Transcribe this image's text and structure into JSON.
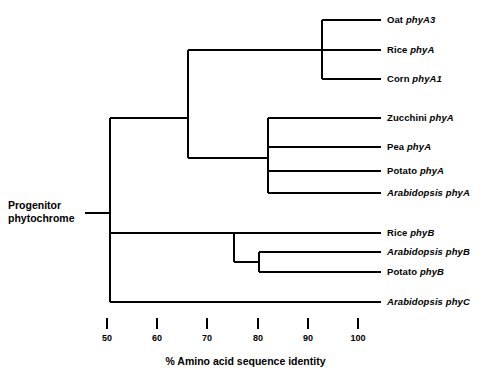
{
  "figure": {
    "type": "phylogenetic-tree",
    "root_label_line1": "Progenitor",
    "root_label_line2": "phytochrome",
    "axis_title": "% Amino acid sequence identity"
  },
  "axis": {
    "ticks": [
      {
        "value": 50,
        "label": "50",
        "x": 107
      },
      {
        "value": 60,
        "label": "60",
        "x": 157
      },
      {
        "value": 70,
        "label": "70",
        "x": 207
      },
      {
        "value": 80,
        "label": "80",
        "x": 258
      },
      {
        "value": 90,
        "label": "90",
        "x": 308
      },
      {
        "value": 100,
        "label": "100",
        "x": 358
      }
    ],
    "min": 50,
    "max": 100,
    "x_min_px": 107,
    "x_max_px": 358
  },
  "leaves": [
    {
      "organism": "Oat",
      "gene": "phyA3",
      "italic_organism": false,
      "y": 20,
      "branch_x": 322
    },
    {
      "organism": "Rice",
      "gene": "phyA",
      "italic_organism": false,
      "y": 50,
      "branch_x": 188
    },
    {
      "organism": "Corn",
      "gene": "phyA1",
      "italic_organism": false,
      "y": 79,
      "branch_x": 322
    },
    {
      "organism": "Zucchini",
      "gene": "phyA",
      "italic_organism": false,
      "y": 118,
      "branch_x": 268
    },
    {
      "organism": "Pea",
      "gene": "phyA",
      "italic_organism": false,
      "y": 147,
      "branch_x": 268
    },
    {
      "organism": "Potato",
      "gene": "phyA",
      "italic_organism": false,
      "y": 171,
      "branch_x": 268
    },
    {
      "organism": "Arabidopsis",
      "gene": "phyA",
      "italic_organism": true,
      "y": 193,
      "branch_x": 268
    },
    {
      "organism": "Rice",
      "gene": "phyB",
      "italic_organism": false,
      "y": 233,
      "branch_x": 234
    },
    {
      "organism": "Arabidopsis",
      "gene": "phyB",
      "italic_organism": true,
      "y": 252,
      "branch_x": 259
    },
    {
      "organism": "Potato",
      "gene": "phyB",
      "italic_organism": false,
      "y": 272,
      "branch_x": 259
    },
    {
      "organism": "Arabidopsis",
      "gene": "phyC",
      "italic_organism": true,
      "y": 302,
      "branch_x": 110
    }
  ],
  "tree_geometry": {
    "leaf_tip_x": 381,
    "label_x": 387,
    "root_stub_x_start": 85,
    "root_x": 110,
    "root_y": 213,
    "root_label_x": 8,
    "root_label_y": 199,
    "nodes": [
      {
        "name": "root-node",
        "x": 110,
        "y_top": 118,
        "y_bottom": 302
      },
      {
        "name": "phyA-node",
        "x": 188,
        "y_top": 50,
        "y_bottom": 158
      },
      {
        "name": "monocot-phyA-node",
        "x": 322,
        "y_top": 20,
        "y_bottom": 79
      },
      {
        "name": "dicot-phyA-node",
        "x": 268,
        "y_top": 118,
        "y_bottom": 193
      },
      {
        "name": "phyB-node",
        "x": 234,
        "y_top": 233,
        "y_bottom": 262
      },
      {
        "name": "phyB-inner-node",
        "x": 259,
        "y_top": 252,
        "y_bottom": 272
      }
    ],
    "connectors": [
      {
        "name": "phyA-node-to-root",
        "x1": 110,
        "x2": 188,
        "y": 118
      },
      {
        "name": "dicot-phyA-to-phyA-node",
        "x1": 188,
        "x2": 268,
        "y": 158
      },
      {
        "name": "phyB-node-to-root",
        "x1": 110,
        "x2": 234,
        "y": 233
      },
      {
        "name": "phyB-inner-to-phyB-node",
        "x1": 234,
        "x2": 259,
        "y": 262
      },
      {
        "name": "root-stub",
        "x1": 85,
        "x2": 110,
        "y": 213
      }
    ]
  },
  "chart_data": {
    "type": "tree",
    "title": "",
    "xlabel": "% Amino acid sequence identity",
    "ylabel": "",
    "xlim": [
      50,
      100
    ],
    "grid": false,
    "legend": "none",
    "root_name": "Progenitor phytochrome",
    "axis_ticks": [
      50,
      60,
      70,
      80,
      90,
      100
    ],
    "taxa": [
      "Oat phyA3",
      "Rice phyA",
      "Corn phyA1",
      "Zucchini phyA",
      "Pea phyA",
      "Potato phyA",
      "Arabidopsis phyA",
      "Rice phyB",
      "Arabidopsis phyB",
      "Potato phyB",
      "Arabidopsis phyC"
    ],
    "node_identity_values": [
      {
        "node": "root (Progenitor phytochrome)",
        "percent_identity": 50,
        "children": [
          "phyA clade",
          "phyB clade",
          "Arabidopsis phyC"
        ]
      },
      {
        "node": "phyA clade ancestor",
        "percent_identity": 65,
        "children": [
          "monocot phyA clade",
          "dicot phyA clade"
        ]
      },
      {
        "node": "monocot phyA clade",
        "percent_identity": 93,
        "children": [
          "Oat phyA3",
          "Corn phyA1"
        ]
      },
      {
        "node": "monocot phyA + Rice phyA",
        "percent_identity": 65,
        "children": [
          "Rice phyA",
          "Oat/Corn clade"
        ]
      },
      {
        "node": "dicot phyA clade",
        "percent_identity": 82,
        "children": [
          "Zucchini phyA",
          "Pea phyA",
          "Potato phyA",
          "Arabidopsis phyA"
        ]
      },
      {
        "node": "phyB clade ancestor",
        "percent_identity": 75,
        "children": [
          "Rice phyB",
          "phyB dicot clade"
        ]
      },
      {
        "node": "phyB dicot clade",
        "percent_identity": 80,
        "children": [
          "Arabidopsis phyB",
          "Potato phyB"
        ]
      }
    ],
    "leaf_identity_percent": 100
  }
}
